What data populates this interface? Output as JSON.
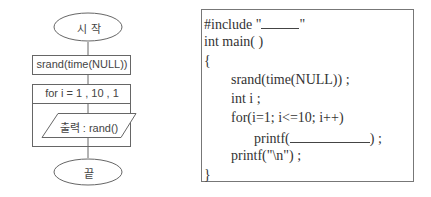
{
  "flowchart": {
    "start": "시 작",
    "step1": "srand(time(NULL))",
    "loop": "for  i = 1 , 10 , 1",
    "output": "출력 : rand()",
    "end": "끝"
  },
  "code": {
    "lines": [
      {
        "text": "#include \"",
        "suffix": "\"",
        "blank_width": 38
      },
      {
        "text": "int  main( )"
      },
      {
        "text": "{"
      },
      {
        "text": "srand(time(NULL)) ;"
      },
      {
        "text": "int  i ;"
      },
      {
        "text": "for(i=1;  i<=10;  i++)"
      },
      {
        "text": "printf(",
        "suffix": ") ;",
        "blank_width": 80
      },
      {
        "text": "printf(\"\\n\") ;"
      },
      {
        "text": "}"
      }
    ]
  }
}
